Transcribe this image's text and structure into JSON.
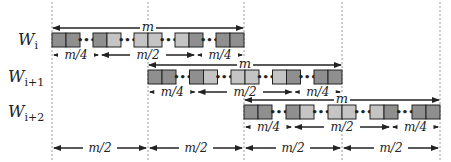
{
  "diagram": {
    "windows": [
      {
        "label": "W",
        "subscript": "i",
        "start_col": 0
      },
      {
        "label": "W",
        "subscript": "i+1",
        "start_col": 1
      },
      {
        "label": "W",
        "subscript": "i+2",
        "start_col": 2
      }
    ],
    "window_length_label": "m",
    "segment_labels": [
      "m/4",
      "m/2",
      "m/4"
    ],
    "bottom_labels": [
      "m/2",
      "m/2",
      "m/2",
      "m/2"
    ],
    "block_groups_per_window": 5,
    "block_shading": [
      [
        "#8f8f8f",
        "#8f8f8f"
      ],
      [
        "#8f8f8f",
        "#c4c4c4"
      ],
      [
        "#c4c4c4",
        "#c4c4c4"
      ],
      [
        "#c4c4c4",
        "#8f8f8f"
      ],
      [
        "#8f8f8f",
        "#8f8f8f"
      ]
    ],
    "ellipsis": "…",
    "colors": {
      "dark_block": "#8f8f8f",
      "light_block": "#c4c4c4",
      "stroke": "#222222",
      "dashed_guide": "#9a9a9a"
    }
  }
}
